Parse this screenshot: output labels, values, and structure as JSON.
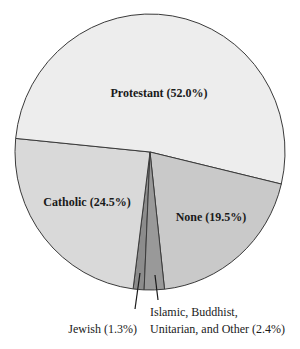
{
  "chart_data": {
    "type": "pie",
    "title": "",
    "categories": [
      "Protestant",
      "Catholic",
      "None",
      "Jewish",
      "Islamic, Buddhist, Unitarian, and Other"
    ],
    "values": [
      52.0,
      24.5,
      19.5,
      1.3,
      2.4
    ],
    "unit": "%",
    "slices": [
      {
        "name": "Jewish",
        "value": 1.3,
        "color": "#8c8c8c",
        "label": "Jewish (1.3%)"
      },
      {
        "name": "Catholic",
        "value": 24.5,
        "color": "#d9d9d9",
        "label": "Catholic (24.5%)"
      },
      {
        "name": "Protestant",
        "value": 52.0,
        "color": "#ededed",
        "label": "Protestant (52.0%)"
      },
      {
        "name": "None",
        "value": 19.5,
        "color": "#c9c9c9",
        "label": "None (19.5%)"
      },
      {
        "name": "Islamic, Buddhist, Unitarian, and Other",
        "value": 2.4,
        "color": "#999999",
        "label_lines": [
          "Islamic, Buddhist,",
          "Unitarian, and Other (2.4%)"
        ]
      }
    ],
    "start_angle_deg": 182.5,
    "direction": "clockwise",
    "legend": "none (direct labels)"
  },
  "labels": {
    "protestant": "Protestant (52.0%)",
    "catholic": "Catholic (24.5%)",
    "none": "None (19.5%)",
    "jewish": "Jewish (1.3%)",
    "other_line1": "Islamic, Buddhist,",
    "other_line2": "Unitarian, and Other (2.4%)"
  }
}
